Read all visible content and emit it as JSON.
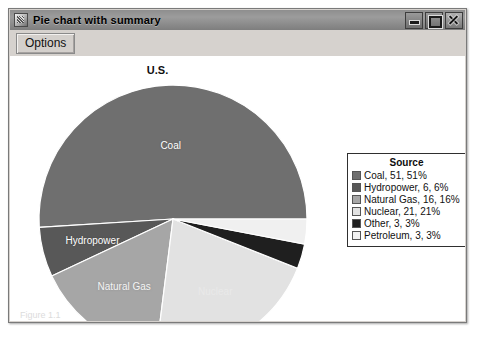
{
  "window": {
    "title": "Pie chart with summary",
    "icon": "app-icon",
    "controls": {
      "minimize": "minimize-icon",
      "maximize": "maximize-icon",
      "close": "close-icon"
    }
  },
  "toolbar": {
    "options_label": "Options"
  },
  "legend": {
    "title": "Source"
  },
  "caption": "Figure 1.1",
  "chart_data": {
    "type": "pie",
    "title": "U.S.",
    "legend_title": "Source",
    "legend_position": "right",
    "start_angle": 0,
    "direction": "counterclockwise",
    "categories": [
      "Coal",
      "Hydropower",
      "Natural Gas",
      "Nuclear",
      "Other",
      "Petroleum"
    ],
    "values": [
      51,
      6,
      16,
      21,
      3,
      3
    ],
    "percentages": [
      51,
      6,
      16,
      21,
      3,
      3
    ],
    "colors": [
      "#6f6f6f",
      "#585858",
      "#a6a6a6",
      "#e2e2e2",
      "#1f1f1f",
      "#f0f0f0"
    ],
    "slice_labels": [
      "Coal",
      "Hydropower",
      "Natural Gas",
      "Nuclear",
      "",
      ""
    ],
    "legend_entries": [
      {
        "label": "Coal, 51, 51%",
        "color": "#6f6f6f"
      },
      {
        "label": "Hydropower, 6, 6%",
        "color": "#585858"
      },
      {
        "label": "Natural Gas, 16, 16%",
        "color": "#a6a6a6"
      },
      {
        "label": "Nuclear, 21, 21%",
        "color": "#e2e2e2"
      },
      {
        "label": "Other, 3, 3%",
        "color": "#1f1f1f"
      },
      {
        "label": "Petroleum, 3, 3%",
        "color": "#f0f0f0"
      }
    ]
  }
}
